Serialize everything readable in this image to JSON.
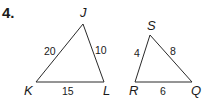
{
  "problem": {
    "number": "4."
  },
  "triangles": [
    {
      "name": "JKL",
      "vertices": {
        "J": {
          "label": "J"
        },
        "K": {
          "label": "K"
        },
        "L": {
          "label": "L"
        }
      },
      "sides": {
        "KJ": "20",
        "JL": "10",
        "KL": "15"
      }
    },
    {
      "name": "SRQ",
      "vertices": {
        "S": {
          "label": "S"
        },
        "R": {
          "label": "R"
        },
        "Q": {
          "label": "Q"
        }
      },
      "sides": {
        "RS": "4",
        "SQ": "8",
        "RQ": "6"
      }
    }
  ]
}
